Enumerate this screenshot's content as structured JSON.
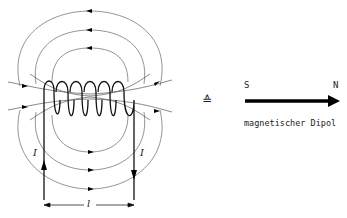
{
  "diagram": {
    "type": "solenoid-magnetic-field",
    "coil": {
      "turns": 6,
      "current_label": "I",
      "length_label": "l"
    },
    "equivalence_symbol": "≙",
    "dipole": {
      "south_label": "S",
      "north_label": "N",
      "caption": "magnetischer Dipol"
    },
    "colors": {
      "line": "#333333",
      "field": "#555555",
      "arrow": "#000000"
    }
  }
}
